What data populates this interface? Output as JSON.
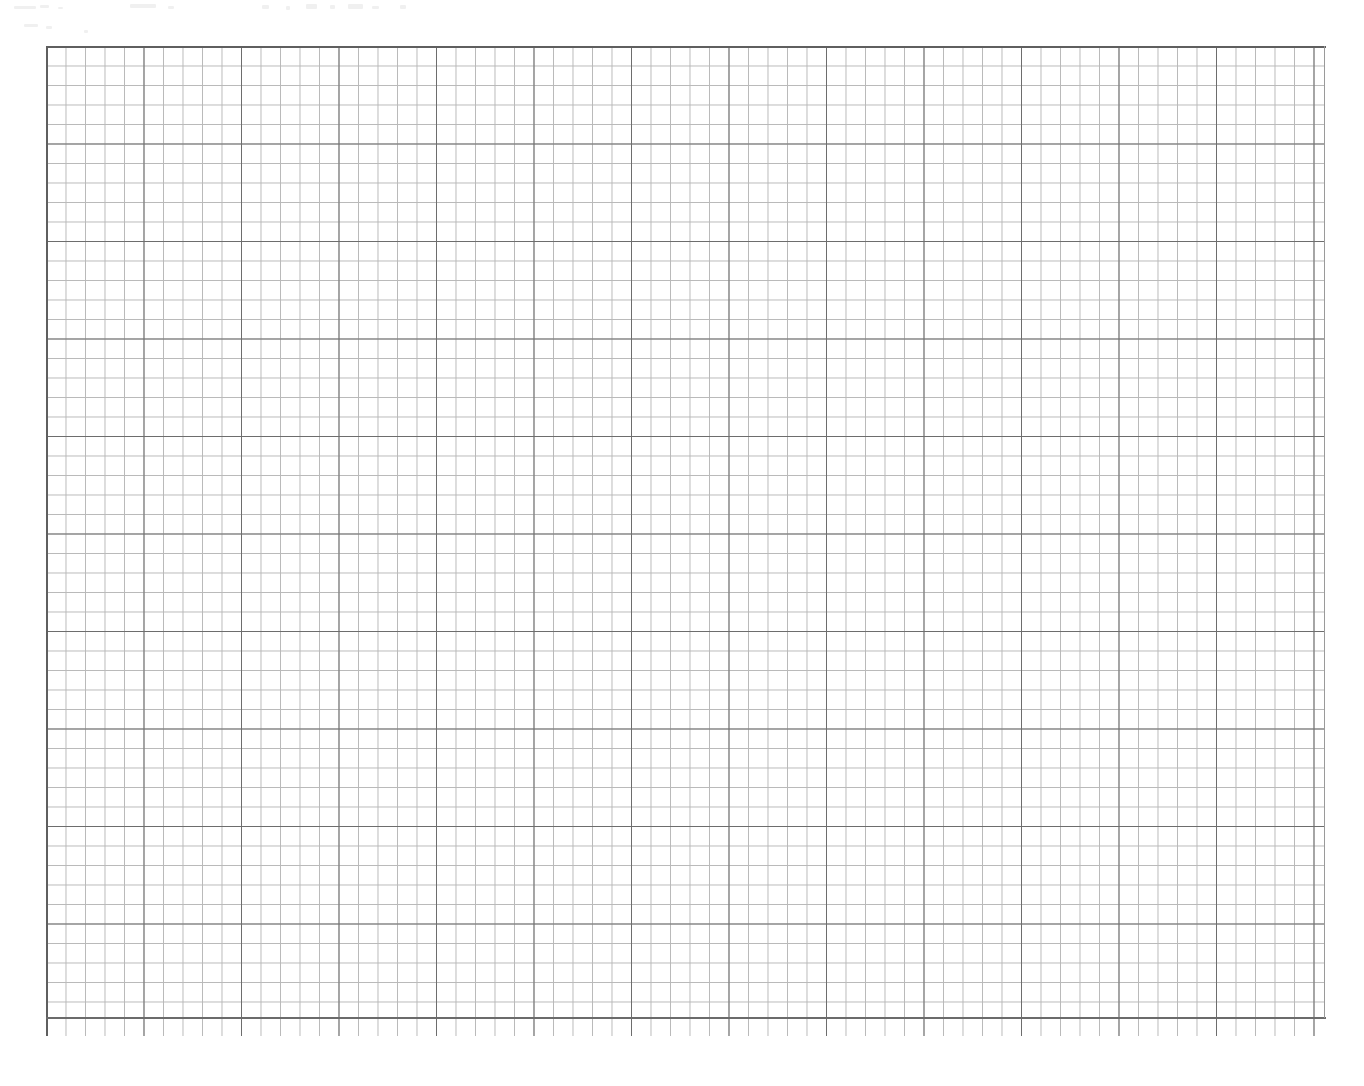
{
  "document": {
    "kind": "scanned-graph-paper",
    "title": "Graph Paper",
    "page_width": 1364,
    "page_height": 1086,
    "background_color": "#ffffff",
    "text_content": "",
    "annotations": [],
    "notes": "Blank scanned sheet of engineering/graph paper. No text, labels, numbers or drawn marks are present anywhere on the page."
  },
  "grid": {
    "name": "graph-paper-grid",
    "origin_x": 46,
    "origin_y": 46,
    "width": 1279,
    "height": 972,
    "minor_cell_px": 19.5,
    "minor_columns": 65,
    "minor_rows": 50,
    "major_every_n_cells": 5,
    "major_cell_px": 97.5,
    "major_columns": 13,
    "major_rows": 10,
    "minor_line_color": "#b9b9b9",
    "major_line_color": "#6d6d6d",
    "frame_color": "#5f5f5f",
    "minor_line_width_px": 1,
    "major_line_width_px": 1.3,
    "underhang_px": 18
  },
  "margins": {
    "left_px": 46,
    "top_px": 46,
    "right_px": 39,
    "bottom_px": 50
  },
  "scan_artifacts": {
    "name": "scanner-noise",
    "region": "top-left strip",
    "opacity": 0.3,
    "description": "faint grey speckles from the scan, no legible content"
  },
  "chart_data": {
    "type": "table",
    "title": "",
    "xlabel": "",
    "ylabel": "",
    "categories": [],
    "values": [],
    "grid": true,
    "legend_position": "none",
    "annotations": []
  }
}
